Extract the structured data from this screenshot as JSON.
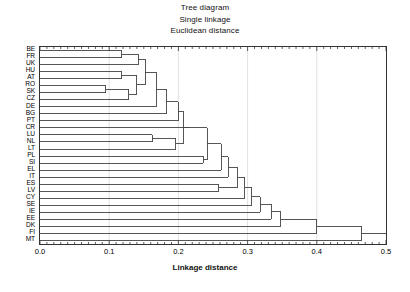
{
  "titles": {
    "line1": "Tree diagram",
    "line2": "Single linkage",
    "line3": "Euclidean distance"
  },
  "axis": {
    "xlabel": "Linkage distance",
    "xticks": [
      "0.0",
      "0.1",
      "0.2",
      "0.3",
      "0.4",
      "0.5"
    ]
  },
  "chart_data": {
    "type": "dendrogram",
    "title": "Tree diagram",
    "subtitle": "Single linkage",
    "metric": "Euclidean distance",
    "orientation": "horizontal",
    "xlabel": "Linkage distance",
    "ylabel": "",
    "xlim": [
      0.0,
      0.5
    ],
    "xticks": [
      0.0,
      0.1,
      0.2,
      0.3,
      0.4,
      0.5
    ],
    "minor_ticks": true,
    "grid": "vertical-major-faint",
    "leaf_order": [
      "BE",
      "FR",
      "UK",
      "HU",
      "AT",
      "RO",
      "SK",
      "CZ",
      "DE",
      "BG",
      "PT",
      "CR",
      "LU",
      "NL",
      "LT",
      "PL",
      "SI",
      "EL",
      "IT",
      "ES",
      "LV",
      "CY",
      "SE",
      "IE",
      "EE",
      "DK",
      "FI",
      "MT"
    ],
    "n_leaves": 28,
    "line_color": "#444444",
    "merges": [
      {
        "id": "m1",
        "left": "BE",
        "right": "FR",
        "height": 0.118
      },
      {
        "id": "m2",
        "left": "HU",
        "right": "AT",
        "height": 0.118
      },
      {
        "id": "m3",
        "left": "RO",
        "right": "SK",
        "height": 0.095
      },
      {
        "id": "m4",
        "left": "m3",
        "right": "CZ",
        "height": 0.128
      },
      {
        "id": "m5",
        "left": "m2",
        "right": "m4",
        "height": 0.14
      },
      {
        "id": "m6",
        "left": "m1",
        "right": "UK",
        "height": 0.142
      },
      {
        "id": "m7",
        "left": "m6",
        "right": "m5",
        "height": 0.152
      },
      {
        "id": "m8",
        "left": "m7",
        "right": "DE",
        "height": 0.168
      },
      {
        "id": "m9",
        "left": "m8",
        "right": "BG",
        "height": 0.183
      },
      {
        "id": "m10",
        "left": "LU",
        "right": "NL",
        "height": 0.162
      },
      {
        "id": "m11",
        "left": "m10",
        "right": "LT",
        "height": 0.196
      },
      {
        "id": "m12",
        "left": "m9",
        "right": "PT",
        "height": 0.2
      },
      {
        "id": "m13",
        "left": "m12",
        "right": "m11",
        "height": 0.207
      },
      {
        "id": "m14",
        "left": "m13",
        "right": "CR",
        "height": 0.214
      },
      {
        "id": "m15",
        "left": "PL",
        "right": "SI",
        "height": 0.236
      },
      {
        "id": "m16",
        "left": "m14",
        "right": "m15",
        "height": 0.242
      },
      {
        "id": "m17",
        "left": "m16",
        "right": "EL",
        "height": 0.262
      },
      {
        "id": "m18",
        "left": "m17",
        "right": "IT",
        "height": 0.272
      },
      {
        "id": "m19",
        "left": "ES",
        "right": "LV",
        "height": 0.258
      },
      {
        "id": "m20",
        "left": "m18",
        "right": "m19",
        "height": 0.285
      },
      {
        "id": "m21",
        "left": "m20",
        "right": "CY",
        "height": 0.296
      },
      {
        "id": "m22",
        "left": "m21",
        "right": "SE",
        "height": 0.306
      },
      {
        "id": "m23",
        "left": "m22",
        "right": "IE",
        "height": 0.318
      },
      {
        "id": "m24",
        "left": "m23",
        "right": "EE",
        "height": 0.334
      },
      {
        "id": "m25",
        "left": "m24",
        "right": "DK",
        "height": 0.348
      },
      {
        "id": "m26",
        "left": "m25",
        "right": "FI",
        "height": 0.4
      },
      {
        "id": "m27",
        "left": "m26",
        "right": "MT",
        "height": 0.465
      }
    ]
  }
}
